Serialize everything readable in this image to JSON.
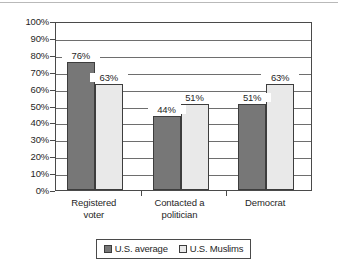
{
  "chart_data": {
    "type": "bar",
    "title": "",
    "subtitle": "",
    "xlabel": "",
    "ylabel": "",
    "categories": [
      "Registered\nvoter",
      "Contacted a\npolitician",
      "Democrat"
    ],
    "series": [
      {
        "name": "U.S. average",
        "color": "#777777",
        "values": [
          76,
          44,
          51
        ],
        "labels": [
          "76%",
          "44%",
          "51%"
        ]
      },
      {
        "name": "U.S. Muslims",
        "color": "#e9e9e9",
        "values": [
          63,
          51,
          63
        ],
        "labels": [
          "63%",
          "51%",
          "63%"
        ]
      }
    ],
    "ylim": [
      0,
      100
    ],
    "ytick_values": [
      0,
      10,
      20,
      30,
      40,
      50,
      60,
      70,
      80,
      90,
      100
    ],
    "ytick_labels": [
      "0%",
      "10%",
      "20%",
      "30%",
      "40%",
      "50%",
      "60%",
      "70%",
      "80%",
      "90%",
      "100%"
    ],
    "grid": true,
    "legend_position": "bottom"
  }
}
